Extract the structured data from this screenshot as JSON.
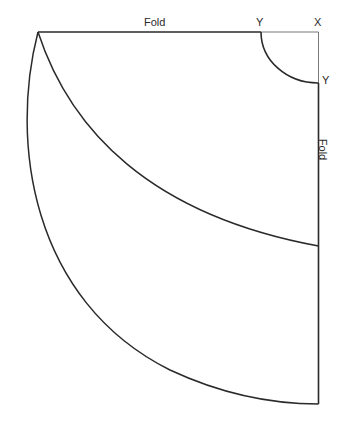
{
  "diagram": {
    "labels": {
      "fold_top": "Fold",
      "fold_right": "Fold",
      "corner": "X",
      "waist_point_top": "Y",
      "waist_point_right": "Y"
    },
    "colors": {
      "line": "#2a2a2a",
      "thin_line": "#555555",
      "background": "#ffffff"
    },
    "elements": [
      {
        "name": "top-fold-edge",
        "description": "Straight fold line along top from hem corner to waist point Y"
      },
      {
        "name": "top-corner-segment",
        "description": "Thin line from waist point Y to corner X"
      },
      {
        "name": "right-corner-segment",
        "description": "Thin line from corner X down to waist point Y"
      },
      {
        "name": "waist-curve",
        "description": "Quarter-circle waist curve between the two Y points"
      },
      {
        "name": "right-fold-edge",
        "description": "Straight fold line down the right side from waist Y to hem"
      },
      {
        "name": "inner-hem-curve",
        "description": "Inner curved line from top-left point to right fold edge"
      },
      {
        "name": "outer-hem-curve",
        "description": "Outer curved hem line from top-left point to bottom of right fold edge"
      }
    ]
  }
}
